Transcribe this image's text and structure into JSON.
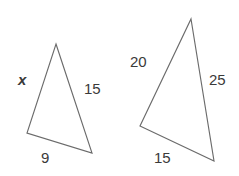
{
  "figure": {
    "background_color": "#ffffff",
    "stroke_color": "#6b6b6b",
    "label_color": "#3a3a3a",
    "triangles": [
      {
        "id": "left-triangle",
        "name": "left triangle",
        "vertices": [
          {
            "name": "apex",
            "x": 56,
            "y": 44
          },
          {
            "name": "bottom-right",
            "x": 92,
            "y": 153
          },
          {
            "name": "bottom-left",
            "x": 27,
            "y": 133
          }
        ],
        "labels": [
          {
            "id": "left-x",
            "text": "x",
            "side": "left",
            "italic": true
          },
          {
            "id": "left-15",
            "text": "15",
            "side": "right",
            "italic": false
          },
          {
            "id": "left-9",
            "text": "9",
            "side": "bottom",
            "italic": false
          }
        ]
      },
      {
        "id": "right-triangle",
        "name": "right triangle",
        "vertices": [
          {
            "name": "apex",
            "x": 191,
            "y": 19
          },
          {
            "name": "bottom-right",
            "x": 214,
            "y": 161
          },
          {
            "name": "bottom-left",
            "x": 140,
            "y": 126
          }
        ],
        "labels": [
          {
            "id": "right-20",
            "text": "20",
            "side": "left",
            "italic": false
          },
          {
            "id": "right-25",
            "text": "25",
            "side": "right",
            "italic": false
          },
          {
            "id": "right-15",
            "text": "15",
            "side": "bottom",
            "italic": false
          }
        ]
      }
    ]
  }
}
